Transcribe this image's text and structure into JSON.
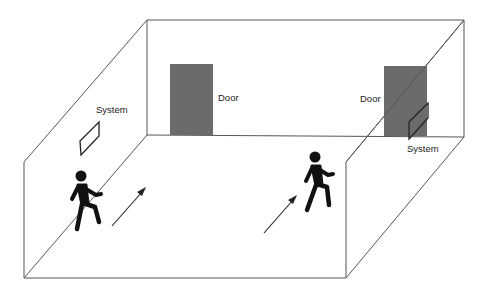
{
  "diagram": {
    "title": "",
    "labels": {
      "door_left": "Door",
      "door_right": "Door",
      "system_left": "System",
      "system_right": "System"
    },
    "colors": {
      "line": "#555555",
      "door": "#6b6b6b",
      "person": "#111111",
      "background": "#ffffff"
    },
    "room": {
      "back_wall": {
        "x1": 147,
        "y1": 20,
        "x2": 464,
        "y2": 137
      },
      "front_left_top": [
        24,
        162
      ],
      "front_left_bottom": [
        24,
        278
      ],
      "front_right_top": [
        346,
        162
      ],
      "front_right_bottom": [
        346,
        278
      ]
    },
    "elements": [
      {
        "type": "door",
        "label": "Door",
        "position": "back wall, left"
      },
      {
        "type": "door",
        "label": "Door",
        "position": "back wall, right"
      },
      {
        "type": "system",
        "label": "System",
        "position": "left wall"
      },
      {
        "type": "system",
        "label": "System",
        "position": "right wall near right door"
      },
      {
        "type": "person",
        "position": "left, walking toward back"
      },
      {
        "type": "person",
        "position": "center-right, walking toward back"
      },
      {
        "type": "arrow",
        "direction": "diagonal toward back",
        "position": "left"
      },
      {
        "type": "arrow",
        "direction": "diagonal toward back",
        "position": "center"
      }
    ]
  }
}
